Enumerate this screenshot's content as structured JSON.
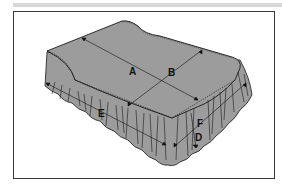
{
  "figure": {
    "colors": {
      "fill": "#9c9c9c",
      "line": "#1a1a1a",
      "frame": "#3a3a3a",
      "topbar": "#d8d8d8"
    },
    "labels": {
      "A": "A",
      "B": "B",
      "C": "",
      "D": "D",
      "E": "E",
      "F": "F"
    }
  }
}
